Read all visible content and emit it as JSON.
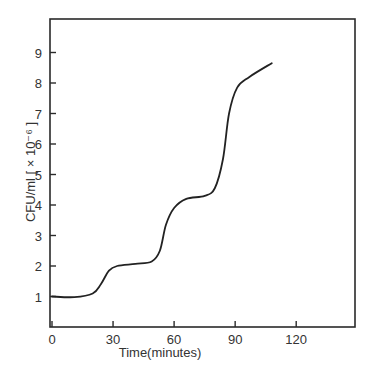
{
  "chart_data": {
    "type": "line",
    "title": "",
    "xlabel": "Time(minutes)",
    "ylabel": "CFU/ml [ × 10⁻⁶ ]",
    "xlim": [
      0,
      142
    ],
    "ylim": [
      0,
      10.2
    ],
    "x_ticks": [
      0,
      30,
      60,
      90,
      120
    ],
    "y_ticks": [
      1,
      2,
      3,
      4,
      5,
      6,
      7,
      8,
      9
    ],
    "grid": false,
    "legend": null,
    "series": [
      {
        "name": "CFU/ml",
        "color": "#222222",
        "x": [
          0,
          11,
          20,
          24,
          28,
          32,
          41,
          49,
          53,
          56,
          60,
          66,
          75,
          80,
          84,
          87,
          91,
          97,
          108
        ],
        "y": [
          1.0,
          0.98,
          1.1,
          1.4,
          1.85,
          2.0,
          2.07,
          2.15,
          2.5,
          3.35,
          3.9,
          4.2,
          4.3,
          4.55,
          5.5,
          7.0,
          7.85,
          8.2,
          8.65
        ]
      }
    ]
  },
  "labels": {
    "x_axis": "Time(minutes)",
    "y_axis_main": "CFU/ml",
    "y_axis_unit": "[ × 10⁻⁶ ]"
  }
}
